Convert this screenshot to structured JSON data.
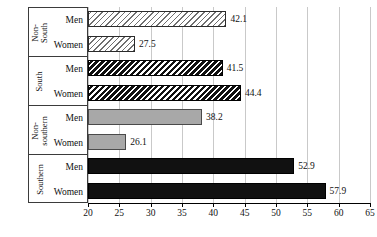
{
  "chart_data": {
    "type": "bar",
    "orientation": "horizontal",
    "title": "",
    "xlabel": "",
    "ylabel": "",
    "xlim": [
      20,
      65
    ],
    "xticks": [
      20,
      25,
      30,
      35,
      40,
      45,
      50,
      55,
      60,
      65
    ],
    "grid": true,
    "legend": "none",
    "categories": [
      "Men",
      "Women"
    ],
    "groups": [
      {
        "label": "Non-South",
        "label_lines": [
          "Non-",
          "South"
        ],
        "style": "hatch-light",
        "bars": [
          {
            "category": "Men",
            "value": 42.1,
            "label": "42.1"
          },
          {
            "category": "Women",
            "value": 27.5,
            "label": "27.5"
          }
        ]
      },
      {
        "label": "South",
        "label_lines": [
          "South"
        ],
        "style": "hatch-dense",
        "bars": [
          {
            "category": "Men",
            "value": 41.5,
            "label": "41.5"
          },
          {
            "category": "Women",
            "value": 44.4,
            "label": "44.4"
          }
        ]
      },
      {
        "label": "Non-southern",
        "label_lines": [
          "Non-",
          "southern"
        ],
        "style": "solid-gray",
        "bars": [
          {
            "category": "Men",
            "value": 38.2,
            "label": "38.2"
          },
          {
            "category": "Women",
            "value": 26.1,
            "label": "26.1"
          }
        ]
      },
      {
        "label": "Southern",
        "label_lines": [
          "Southern"
        ],
        "style": "solid-black",
        "bars": [
          {
            "category": "Men",
            "value": 52.9,
            "label": "52.9"
          },
          {
            "category": "Women",
            "value": 57.9,
            "label": "57.9"
          }
        ]
      }
    ],
    "colors": {
      "solid_gray": "#a8a8a8",
      "solid_black": "#111111",
      "gridline": "#c9c9c9",
      "axis": "#000000",
      "text": "#111111",
      "panel_border": "#3b3b3b"
    }
  },
  "axis": {
    "tick_labels": [
      "20",
      "25",
      "30",
      "35",
      "40",
      "45",
      "50",
      "55",
      "60",
      "65"
    ]
  },
  "panel": {
    "groups": [
      {
        "name": "Non-South",
        "line1": "Non-",
        "line2": "South",
        "rows": [
          "Men",
          "Women"
        ]
      },
      {
        "name": "South",
        "line1": "South",
        "line2": "",
        "rows": [
          "Men",
          "Women"
        ]
      },
      {
        "name": "Non-southern",
        "line1": "Non-",
        "line2": "southern",
        "rows": [
          "Men",
          "Women"
        ]
      },
      {
        "name": "Southern",
        "line1": "Southern",
        "line2": "",
        "rows": [
          "Men",
          "Women"
        ]
      }
    ]
  }
}
